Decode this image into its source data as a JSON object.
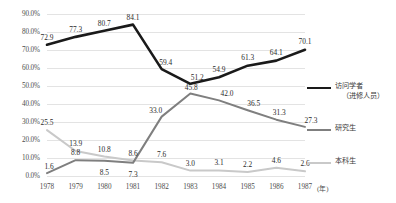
{
  "chart_data": {
    "type": "line",
    "title": "",
    "xlabel": "年",
    "ylabel": "",
    "categories": [
      "1978",
      "1979",
      "1980",
      "1981",
      "1982",
      "1983",
      "1984",
      "1985",
      "1986",
      "1987"
    ],
    "ylim": [
      0,
      90
    ],
    "ytick_labels": [
      "0.0%",
      "10.0%",
      "20.0%",
      "30.0%",
      "40.0%",
      "50.0%",
      "60.0%",
      "70.0%",
      "80.0%",
      "90.0%"
    ],
    "ytick_values": [
      0,
      10,
      20,
      30,
      40,
      50,
      60,
      70,
      80,
      90
    ],
    "grid": true,
    "grid_axis": "y",
    "legend_position": "right",
    "series": [
      {
        "name": "访问学者",
        "name_sub": "（进修人员）",
        "color": "#1a1a1a",
        "width": 2.6,
        "values": [
          72.9,
          77.3,
          80.7,
          84.1,
          59.4,
          51.2,
          54.9,
          61.3,
          64.1,
          70.1
        ],
        "labels": [
          "72.9",
          "77.3",
          "80.7",
          "84.1",
          "59.4",
          "51.2",
          "54.9",
          "61.3",
          "64.1",
          "70.1"
        ]
      },
      {
        "name": "研究生",
        "name_sub": "",
        "color": "#7f7f7f",
        "width": 2.0,
        "values": [
          1.6,
          8.8,
          8.5,
          7.3,
          33.0,
          45.8,
          42.0,
          36.5,
          31.3,
          27.3
        ],
        "labels": [
          "1.6",
          "8.8",
          "8.5",
          "7.3",
          "33.0",
          "45.8",
          "42.0",
          "36.5",
          "31.3",
          "27.3"
        ]
      },
      {
        "name": "本科生",
        "name_sub": "",
        "color": "#c9c9c9",
        "width": 2.0,
        "values": [
          25.5,
          13.9,
          10.8,
          8.6,
          7.6,
          3.0,
          3.1,
          2.2,
          4.6,
          2.6
        ],
        "labels": [
          "25.5",
          "13.9",
          "10.8",
          "8.6",
          "7.6",
          "3.0",
          "3.1",
          "2.2",
          "4.6",
          "2.6"
        ]
      }
    ],
    "data_label_offsets": [
      [
        [
          0,
          -9
        ],
        [
          0,
          -9
        ],
        [
          0,
          -9
        ],
        [
          0,
          -9
        ],
        [
          4,
          -8
        ],
        [
          7,
          -8
        ],
        [
          0,
          -9
        ],
        [
          0,
          -10
        ],
        [
          0,
          -10
        ],
        [
          0,
          -10
        ]
      ],
      [
        [
          2,
          -8
        ],
        [
          0,
          -9
        ],
        [
          0,
          10
        ],
        [
          0,
          10
        ],
        [
          -6,
          -8
        ],
        [
          1,
          -8
        ],
        [
          8,
          -8
        ],
        [
          6,
          -8
        ],
        [
          3,
          -9
        ],
        [
          6,
          -8
        ]
      ],
      [
        [
          0,
          -9
        ],
        [
          0,
          -9
        ],
        [
          0,
          -9
        ],
        [
          0,
          -9
        ],
        [
          0,
          -9
        ],
        [
          0,
          -9
        ],
        [
          0,
          -9
        ],
        [
          0,
          -9
        ],
        [
          0,
          -9
        ],
        [
          0,
          -9
        ]
      ]
    ]
  },
  "axis": {
    "x_unit_label": "(年)"
  }
}
